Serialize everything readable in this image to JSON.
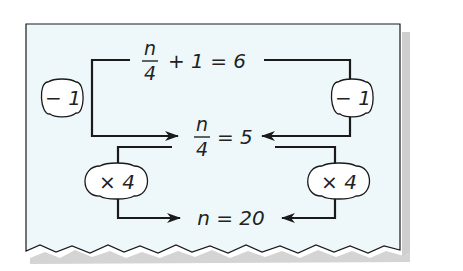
{
  "colors": {
    "panel": "#eef8fb",
    "stroke": "#1a1a1a",
    "shadow": "#c8c8c8"
  },
  "equations": {
    "top": {
      "numerator": "n",
      "denominator": "4",
      "rest": "+ 1 = 6"
    },
    "middle": {
      "numerator": "n",
      "denominator": "4",
      "rest": "= 5"
    },
    "bottom": {
      "text": "n = 20"
    }
  },
  "operations": {
    "left_upper": "− 1",
    "right_upper": "− 1",
    "left_lower": "× 4",
    "right_lower": "× 4"
  }
}
